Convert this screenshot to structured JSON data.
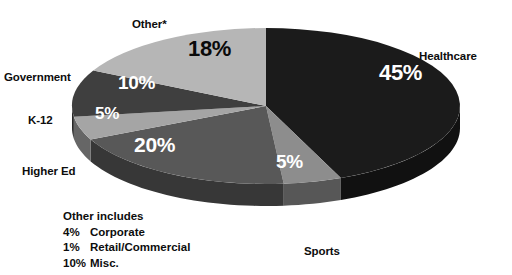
{
  "chart_data": {
    "type": "pie",
    "title": "",
    "subtitle": "",
    "three_d": true,
    "legend_position": "outside-callout",
    "grid": false,
    "start_angle_deg": 0,
    "direction": "clockwise",
    "categories": [
      "Healthcare",
      "Sports",
      "Higher Ed",
      "K-12",
      "Government",
      "Other*"
    ],
    "values": [
      45,
      5,
      20,
      5,
      10,
      18
    ],
    "value_labels": [
      "45%",
      "5%",
      "20%",
      "5%",
      "10%",
      "18%"
    ],
    "colors": [
      "#1b1b1b",
      "#8d8d8d",
      "#585858",
      "#a5a5a5",
      "#3f3f3f",
      "#b6b6b6"
    ],
    "label_text_colors": [
      "#ffffff",
      "#ffffff",
      "#ffffff",
      "#ffffff",
      "#ffffff",
      "#0a0a0a"
    ],
    "slices": [
      {
        "name": "Healthcare",
        "value": 45,
        "label": "45%",
        "color": "#1b1b1b"
      },
      {
        "name": "Sports",
        "value": 5,
        "label": "5%",
        "color": "#8d8d8d"
      },
      {
        "name": "Higher Ed",
        "value": 20,
        "label": "20%",
        "color": "#585858"
      },
      {
        "name": "K-12",
        "value": 5,
        "label": "5%",
        "color": "#a5a5a5"
      },
      {
        "name": "Government",
        "value": 10,
        "label": "10%",
        "color": "#3f3f3f"
      },
      {
        "name": "Other*",
        "value": 18,
        "label": "18%",
        "color": "#b6b6b6"
      }
    ],
    "annotations": {
      "footnote_title": "Other includes",
      "footnote_items": [
        {
          "pct": "4%",
          "name": "Corporate"
        },
        {
          "pct": "1%",
          "name": "Retail/Commercial"
        },
        {
          "pct": "10%",
          "name": "Misc."
        }
      ]
    }
  },
  "labels": {
    "other": "Other*",
    "government": "Government",
    "k12": "K-12",
    "higher_ed": "Higher Ed",
    "healthcare": "Healthcare",
    "sports": "Sports"
  },
  "percents": {
    "healthcare": "45%",
    "other": "18%",
    "government": "10%",
    "k12": "5%",
    "higher_ed": "20%",
    "sports": "5%"
  },
  "footnote": {
    "title": "Other includes",
    "rows": [
      {
        "pct": "4%",
        "name": "Corporate"
      },
      {
        "pct": "1%",
        "name": "Retail/Commercial"
      },
      {
        "pct": "10%",
        "name": "Misc."
      }
    ]
  }
}
